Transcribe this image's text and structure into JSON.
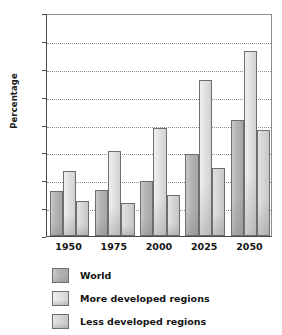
{
  "chart_data": {
    "type": "bar",
    "title": "",
    "subtitle": "",
    "xlabel": "",
    "ylabel": "Percentage",
    "categories": [
      "1950",
      "1975",
      "2000",
      "2025",
      "2050"
    ],
    "series": [
      {
        "name": "World",
        "values": [
          8.0,
          8.3,
          9.8,
          14.8,
          20.8
        ]
      },
      {
        "name": "More developed regions",
        "values": [
          11.7,
          15.3,
          19.3,
          28.0,
          33.2
        ]
      },
      {
        "name": "Less developed regions",
        "values": [
          6.3,
          5.9,
          7.4,
          12.2,
          19.1
        ]
      }
    ],
    "ylim": [
      0,
      40
    ],
    "yticks": [
      0,
      5,
      10,
      15,
      20,
      25,
      30,
      35,
      40
    ],
    "ytick_labels": [
      "0",
      "5",
      "10",
      "15",
      "20",
      "25",
      "30",
      "35",
      "40"
    ],
    "grid": true,
    "grid_style": "dotted",
    "legend_position": "bottom-left",
    "colors": {
      "world": "#b4b4b4",
      "more_developed": "#e2e2e2",
      "less_developed": "#d6d6d6",
      "axis": "#4a4a4a",
      "grid": "#8f8f8f",
      "bar_edge": "#6e6e6e",
      "background": "#ffffff",
      "text": "#141414"
    }
  },
  "legend": {
    "items": [
      {
        "label": "World"
      },
      {
        "label": "More developed regions"
      },
      {
        "label": "Less developed regions"
      }
    ]
  }
}
